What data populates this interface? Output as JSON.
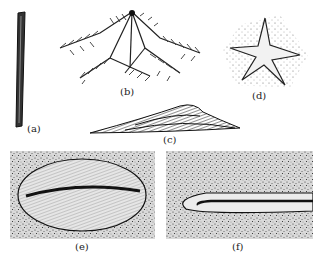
{
  "figure": {
    "panels": [
      {
        "id": "a",
        "label": "(a)",
        "subject": "rod-shaped fossil"
      },
      {
        "id": "b",
        "label": "(b)",
        "subject": "branching fern-like fossil"
      },
      {
        "id": "c",
        "label": "(c)",
        "subject": "layered wedge-shaped fossil"
      },
      {
        "id": "d",
        "label": "(d)",
        "subject": "starfish-shaped impression"
      },
      {
        "id": "e",
        "label": "(e)",
        "subject": "oval segmented impression on stippled sediment"
      },
      {
        "id": "f",
        "label": "(f)",
        "subject": "elongated looped trail on stippled sediment"
      }
    ]
  }
}
